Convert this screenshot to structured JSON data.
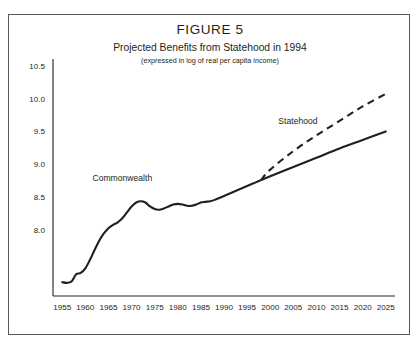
{
  "figure": {
    "title": "FIGURE 5",
    "subtitle": "Projected Benefits from Statehood in 1994",
    "note": "(expressed in log of real per capita income)"
  },
  "chart_data": {
    "type": "line",
    "title": "Projected Benefits from Statehood in 1994",
    "subtitle": "(expressed in log of real per capita income)",
    "xlabel": "",
    "ylabel": "",
    "xlim": [
      1953,
      2027
    ],
    "ylim": [
      7.0,
      10.6
    ],
    "grid": false,
    "legend_position": "inline-annotations",
    "xticks": [
      1955,
      1960,
      1965,
      1970,
      1975,
      1980,
      1985,
      1990,
      1995,
      2000,
      2005,
      2010,
      2015,
      2020,
      2025
    ],
    "yticks": [
      8.0,
      8.5,
      9.0,
      9.5,
      10.0,
      10.5
    ],
    "ytick_labels": [
      "8.0",
      "8.5",
      "9.0",
      "9.5",
      "10.0",
      "10.5"
    ],
    "annotations": [
      {
        "text": "Commonwealth",
        "x": 1968,
        "y": 8.75
      },
      {
        "text": "Statehood",
        "x": 2006,
        "y": 9.62
      }
    ],
    "branch_year": 1998,
    "series": [
      {
        "name": "Commonwealth",
        "style": "solid",
        "color": "#231f20",
        "x": [
          1955,
          1956,
          1957,
          1958,
          1959,
          1960,
          1961,
          1962,
          1963,
          1964,
          1965,
          1966,
          1967,
          1968,
          1969,
          1970,
          1971,
          1972,
          1973,
          1974,
          1975,
          1976,
          1977,
          1978,
          1979,
          1980,
          1981,
          1982,
          1983,
          1984,
          1985,
          1986,
          1987,
          1988,
          1989,
          1990,
          1991,
          1992,
          1993,
          1994,
          1995,
          1996,
          1997,
          1998,
          2000,
          2005,
          2010,
          2015,
          2020,
          2025
        ],
        "y": [
          7.21,
          7.2,
          7.22,
          7.33,
          7.35,
          7.42,
          7.55,
          7.7,
          7.84,
          7.95,
          8.03,
          8.08,
          8.12,
          8.18,
          8.27,
          8.36,
          8.42,
          8.44,
          8.42,
          8.36,
          8.32,
          8.31,
          8.33,
          8.36,
          8.39,
          8.4,
          8.39,
          8.37,
          8.37,
          8.39,
          8.42,
          8.43,
          8.44,
          8.46,
          8.49,
          8.52,
          8.55,
          8.58,
          8.61,
          8.64,
          8.67,
          8.7,
          8.73,
          8.76,
          8.82,
          8.96,
          9.1,
          9.24,
          9.37,
          9.5
        ]
      },
      {
        "name": "Statehood",
        "style": "dashed",
        "color": "#231f20",
        "x": [
          1998,
          2000,
          2005,
          2010,
          2015,
          2020,
          2025
        ],
        "y": [
          8.76,
          8.92,
          9.2,
          9.44,
          9.66,
          9.88,
          10.07
        ]
      }
    ]
  }
}
